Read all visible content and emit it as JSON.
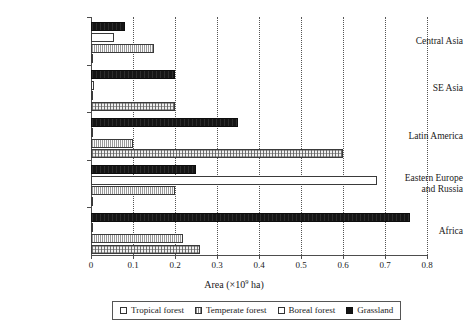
{
  "chart_data": {
    "type": "bar",
    "orientation": "horizontal",
    "title": "",
    "xlabel": "Area (×10⁹ ha)",
    "xlabel_parts": {
      "prefix": "Area (×10",
      "exponent": "9",
      "suffix": " ha)"
    },
    "ylabel": "",
    "categories": [
      "Central Asia",
      "SE Asia",
      "Latin America",
      "Eastern Europe and Russia",
      "Africa"
    ],
    "category_labels_multiline": [
      "Central Asia",
      "SE Asia",
      "Latin America",
      "Eastern Europe\nand Russia",
      "Africa"
    ],
    "series": [
      {
        "name": "Tropical forest",
        "pattern": "tropical",
        "values": [
          0.0,
          0.2,
          0.6,
          0.0,
          0.26
        ]
      },
      {
        "name": "Temperate forest",
        "pattern": "temperate",
        "values": [
          0.15,
          0.0,
          0.1,
          0.2,
          0.22
        ]
      },
      {
        "name": "Boreal forest",
        "pattern": "boreal",
        "values": [
          0.055,
          0.008,
          0.0,
          0.68,
          0.0
        ]
      },
      {
        "name": "Grassland",
        "pattern": "grassland",
        "values": [
          0.08,
          0.2,
          0.35,
          0.25,
          0.76
        ]
      }
    ],
    "xlim": [
      0,
      0.8
    ],
    "xticks": [
      0,
      0.1,
      0.2,
      0.3,
      0.4,
      0.5,
      0.6,
      0.7,
      0.8
    ],
    "xtick_labels": [
      "0",
      "0.1",
      "0.2",
      "0.3",
      "0.4",
      "0.5",
      "0.6",
      "0.7",
      "0.8"
    ],
    "grid": true,
    "grid_axis": "x",
    "grid_style": "dotted",
    "legend_position": "bottom",
    "legend_entries": [
      "Tropical forest",
      "Temperate forest",
      "Boreal forest",
      "Grassland"
    ],
    "bar_draw_order_top_to_bottom": [
      "Grassland",
      "Boreal forest",
      "Temperate forest",
      "Tropical forest"
    ],
    "colors": {
      "grassland": "#151515",
      "boreal": "#ffffff",
      "temperate": "#fbfbfb",
      "tropical": "#f0f0f0",
      "axis": "#4d4d4d",
      "text": "#1a1a1a",
      "background": "#ffffff"
    }
  }
}
